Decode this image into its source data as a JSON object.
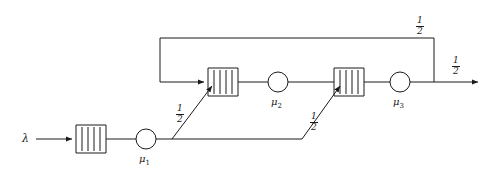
{
  "diagram": {
    "type": "queueing-network",
    "arrival": {
      "label": "λ",
      "name": "arrival-rate-lambda"
    },
    "stations": [
      {
        "id": "station-1",
        "server_label": "μ",
        "server_index": "1",
        "queue_slots": 4
      },
      {
        "id": "station-2",
        "server_label": "μ",
        "server_index": "2",
        "queue_slots": 4
      },
      {
        "id": "station-3",
        "server_label": "μ",
        "server_index": "3",
        "queue_slots": 4
      }
    ],
    "routing_probabilities": [
      {
        "id": "branch-to-station-2",
        "numerator": "1",
        "denominator": "2"
      },
      {
        "id": "branch-to-station-3",
        "numerator": "1",
        "denominator": "2"
      },
      {
        "id": "feedback-to-station-2",
        "numerator": "1",
        "denominator": "2"
      },
      {
        "id": "departure-split",
        "numerator": "1",
        "denominator": "2"
      }
    ],
    "colors": {
      "stroke": "#1a1a1a",
      "background": "#ffffff"
    }
  }
}
